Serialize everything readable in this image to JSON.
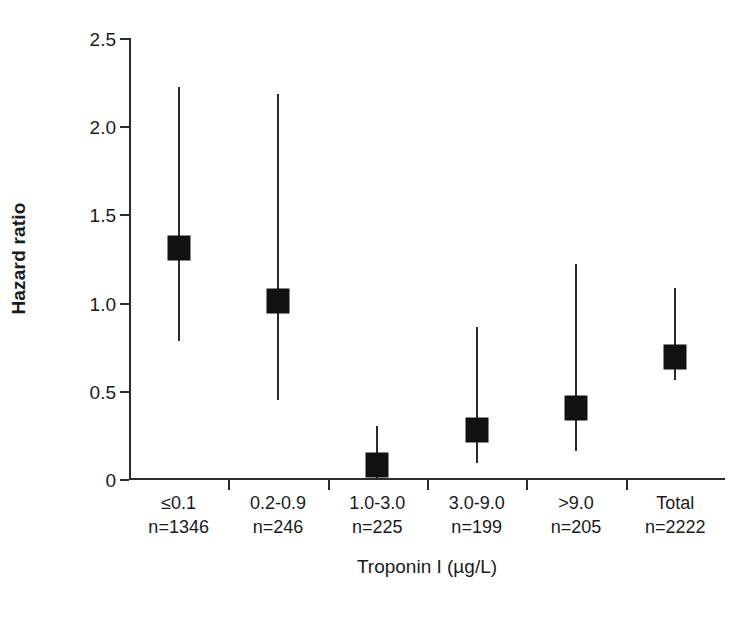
{
  "chart_data": {
    "type": "scatter",
    "title": "",
    "xlabel": "Troponin I (µg/L)",
    "ylabel": "Hazard ratio",
    "ylim": [
      0,
      2.5
    ],
    "yticks": [
      "0",
      "0.5",
      "1.0",
      "1.5",
      "2.0",
      "2.5"
    ],
    "ytick_values": [
      0,
      0.5,
      1.0,
      1.5,
      2.0,
      2.5
    ],
    "grid": false,
    "legend": "none",
    "marker_style": "filled-square",
    "error_bars": "vertical-line-95ci",
    "categories": [
      "≤0.1",
      "0.2-0.9",
      "1.0-3.0",
      "3.0-9.0",
      ">9.0",
      "Total"
    ],
    "category_counts": [
      "n=1346",
      "n=246",
      "n=225",
      "n=199",
      "n=205",
      "n=2222"
    ],
    "values": [
      1.31,
      1.01,
      0.08,
      0.28,
      0.4,
      0.69
    ],
    "ci_low": [
      0.78,
      0.45,
      0.0,
      0.09,
      0.16,
      0.56
    ],
    "ci_high": [
      2.22,
      2.18,
      0.3,
      0.86,
      1.22,
      1.08
    ],
    "points": [
      {
        "category": "≤0.1",
        "n": "n=1346",
        "hr": 1.31,
        "low": 0.78,
        "high": 2.22
      },
      {
        "category": "0.2-0.9",
        "n": "n=246",
        "hr": 1.01,
        "low": 0.45,
        "high": 2.18
      },
      {
        "category": "1.0-3.0",
        "n": "n=225",
        "hr": 0.08,
        "low": 0.0,
        "high": 0.3
      },
      {
        "category": "3.0-9.0",
        "n": "n=199",
        "hr": 0.28,
        "low": 0.09,
        "high": 0.86
      },
      {
        "category": ">9.0",
        "n": "n=205",
        "hr": 0.4,
        "low": 0.16,
        "high": 1.22
      },
      {
        "category": "Total",
        "n": "n=2222",
        "hr": 0.69,
        "low": 0.56,
        "high": 1.08
      }
    ],
    "colors": {
      "marker": "#111111",
      "axis": "#2b2b2b",
      "text": "#1a1a1a",
      "background": "#ffffff"
    }
  }
}
